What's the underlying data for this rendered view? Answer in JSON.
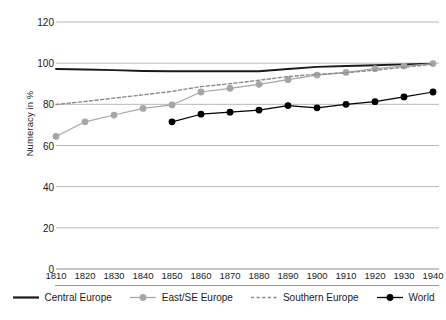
{
  "axes": {
    "ylabel": "Numeracy in %",
    "yticks": [
      0,
      20,
      40,
      60,
      80,
      100,
      120
    ],
    "xticks": [
      1810,
      1820,
      1830,
      1840,
      1850,
      1860,
      1870,
      1880,
      1890,
      1900,
      1910,
      1920,
      1930,
      1940
    ]
  },
  "legend": {
    "items": [
      {
        "label": "Central Europe",
        "icon": "solid-line-swatch",
        "color": "#1a1a1a"
      },
      {
        "label": "East/SE Europe",
        "icon": "line-marker-swatch",
        "color": "#a6a6a6"
      },
      {
        "label": "Southern Europe",
        "icon": "dashed-line-swatch",
        "color": "#8c8c8c"
      },
      {
        "label": "World",
        "icon": "line-marker-swatch",
        "color": "#000000"
      }
    ]
  },
  "chart_data": {
    "type": "line",
    "title": "",
    "xlabel": "",
    "ylabel": "Numeracy in %",
    "xlim": [
      1805,
      1945
    ],
    "ylim": [
      0,
      120
    ],
    "grid": true,
    "legend_position": "bottom",
    "x": [
      1810,
      1820,
      1830,
      1840,
      1850,
      1860,
      1870,
      1880,
      1890,
      1900,
      1910,
      1920,
      1930,
      1940
    ],
    "series": [
      {
        "name": "Central Europe",
        "color": "#1a1a1a",
        "style": "solid",
        "markers": false,
        "values": [
          97.2,
          96.9,
          96.6,
          96.2,
          96.1,
          96.1,
          96.1,
          96.1,
          97.2,
          98.2,
          98.6,
          99.0,
          99.4,
          99.8
        ]
      },
      {
        "name": "East/SE Europe",
        "color": "#a6a6a6",
        "style": "solid",
        "markers": true,
        "values": [
          64.4,
          71.5,
          74.8,
          78.0,
          79.7,
          86.0,
          87.8,
          89.7,
          92.0,
          94.2,
          95.5,
          97.3,
          98.6,
          99.8
        ]
      },
      {
        "name": "Southern Europe",
        "color": "#8c8c8c",
        "style": "dashed",
        "markers": false,
        "values": [
          79.9,
          81.4,
          83.0,
          84.6,
          86.3,
          88.6,
          90.0,
          91.7,
          93.5,
          94.6,
          95.3,
          96.6,
          98.0,
          99.5
        ]
      },
      {
        "name": "World",
        "color": "#000000",
        "style": "solid",
        "markers": true,
        "values": [
          null,
          null,
          null,
          null,
          71.5,
          75.2,
          76.2,
          77.2,
          79.4,
          78.3,
          80.0,
          81.3,
          83.6,
          86.0
        ]
      }
    ]
  }
}
